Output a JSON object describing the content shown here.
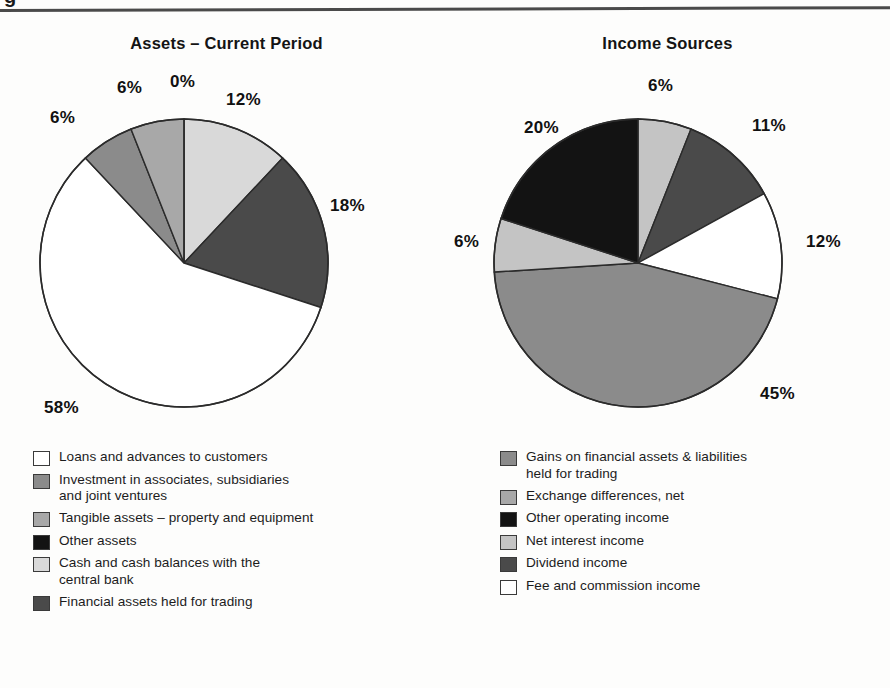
{
  "page": {
    "header_glyph_fragment": "g",
    "background": "#fdfdfc",
    "rule_color": "#4a4a4a"
  },
  "palette": {
    "white": "#ffffff",
    "very_light_gray": "#d9d9d9",
    "light_gray": "#c4c4c4",
    "medium_light_gray": "#a8a8a8",
    "medium_gray": "#8b8b8b",
    "dark_gray": "#4a4a4a",
    "black": "#131313",
    "outline": "#2b2b2b"
  },
  "chart_data": [
    {
      "type": "pie",
      "title": "Assets – Current Period",
      "start_angle_deg": 0,
      "direction": "clockwise",
      "total": 100,
      "labels_suffix": "%",
      "slices": [
        {
          "label": "Cash and cash balances with the central bank",
          "value": 12,
          "display": "12%",
          "color": "#d9d9d9"
        },
        {
          "label": "Financial assets held for trading",
          "value": 18,
          "display": "18%",
          "color": "#4a4a4a"
        },
        {
          "label": "Loans and advances to customers",
          "value": 58,
          "display": "58%",
          "color": "#ffffff"
        },
        {
          "label": "Investment in associates, subsidiaries and joint ventures",
          "value": 6,
          "display": "6%",
          "color": "#8b8b8b"
        },
        {
          "label": "Tangible assets – property and equipment",
          "value": 6,
          "display": "6%",
          "color": "#a8a8a8"
        },
        {
          "label": "Other assets",
          "value": 0,
          "display": "0%",
          "color": "#131313"
        }
      ],
      "legend_position": "below",
      "legend": [
        {
          "label_line1": "Loans and advances to customers",
          "label_line2": "",
          "color": "#ffffff"
        },
        {
          "label_line1": "Investment in associates, subsidiaries",
          "label_line2": "and joint ventures",
          "color": "#8b8b8b"
        },
        {
          "label_line1": "Tangible assets – property and equipment",
          "label_line2": "",
          "color": "#a8a8a8"
        },
        {
          "label_line1": "Other assets",
          "label_line2": "",
          "color": "#131313"
        },
        {
          "label_line1": "Cash and cash balances with the",
          "label_line2": "central bank",
          "color": "#d9d9d9"
        },
        {
          "label_line1": "Financial assets held for trading",
          "label_line2": "",
          "color": "#4a4a4a"
        }
      ]
    },
    {
      "type": "pie",
      "title": "Income Sources",
      "start_angle_deg": 0,
      "direction": "clockwise",
      "total": 100,
      "labels_suffix": "%",
      "slices": [
        {
          "label": "Net interest income",
          "value": 6,
          "display": "6%",
          "color": "#c4c4c4"
        },
        {
          "label": "Dividend income",
          "value": 11,
          "display": "11%",
          "color": "#4a4a4a"
        },
        {
          "label": "Fee and commission income",
          "value": 12,
          "display": "12%",
          "color": "#ffffff"
        },
        {
          "label": "Gains on financial assets & liabilities held for trading",
          "value": 45,
          "display": "45%",
          "color": "#8b8b8b"
        },
        {
          "label": "Exchange differences, net",
          "value": 6,
          "display": "6%",
          "color": "#c4c4c4"
        },
        {
          "label": "Other operating income",
          "value": 20,
          "display": "20%",
          "color": "#131313"
        }
      ],
      "legend_position": "below",
      "legend": [
        {
          "label_line1": "Gains on financial assets & liabilities",
          "label_line2": "held for trading",
          "color": "#8b8b8b"
        },
        {
          "label_line1": "Exchange differences, net",
          "label_line2": "",
          "color": "#a8a8a8"
        },
        {
          "label_line1": "Other operating income",
          "label_line2": "",
          "color": "#131313"
        },
        {
          "label_line1": "Net interest income",
          "label_line2": "",
          "color": "#c4c4c4"
        },
        {
          "label_line1": "Dividend income",
          "label_line2": "",
          "color": "#4a4a4a"
        },
        {
          "label_line1": "Fee and commission income",
          "label_line2": "",
          "color": "#ffffff"
        }
      ]
    }
  ],
  "annotations": {
    "left_labels": [
      {
        "text": "6%",
        "x": 117,
        "y": 78
      },
      {
        "text": "0%",
        "x": 170,
        "y": 72
      },
      {
        "text": "12%",
        "x": 226,
        "y": 90
      },
      {
        "text": "6%",
        "x": 50,
        "y": 108
      },
      {
        "text": "18%",
        "x": 330,
        "y": 196
      },
      {
        "text": "58%",
        "x": 44,
        "y": 398
      }
    ],
    "right_labels": [
      {
        "text": "6%",
        "x": 648,
        "y": 76
      },
      {
        "text": "11%",
        "x": 752,
        "y": 116
      },
      {
        "text": "20%",
        "x": 524,
        "y": 118
      },
      {
        "text": "12%",
        "x": 806,
        "y": 232
      },
      {
        "text": "6%",
        "x": 454,
        "y": 232
      },
      {
        "text": "45%",
        "x": 760,
        "y": 384
      }
    ]
  }
}
